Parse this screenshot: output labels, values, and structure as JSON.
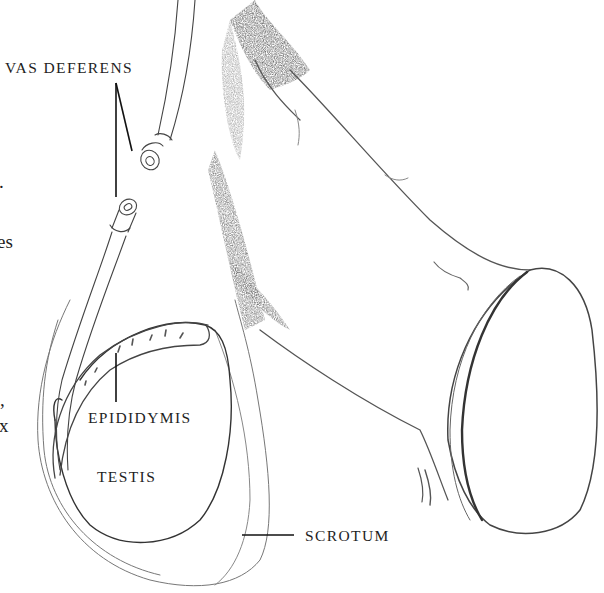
{
  "figure": {
    "type": "anatomical-illustration",
    "labels": {
      "vas_deferens": "VAS DEFERENS",
      "epididymis": "EPIDIDYMIS",
      "testis": "TESTIS",
      "scrotum": "SCROTUM"
    },
    "cropped_margin_text": [
      ".",
      "es",
      ",",
      "x"
    ],
    "colors": {
      "ink": "#1e1e1e",
      "pencil": "#555555",
      "shade": "#6a6a6a",
      "background": "#ffffff"
    }
  }
}
